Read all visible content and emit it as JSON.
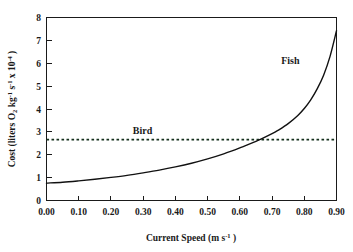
{
  "chart_data": {
    "type": "line",
    "title": "",
    "xlabel_parts": {
      "main": "Current Speed (m s",
      "exponent": "-1",
      "tail": " )"
    },
    "ylabel_parts": {
      "p1": "Cost (liters O",
      "sub1": "2",
      "p2": " kg",
      "sup1": "-1",
      "p3": " s",
      "sup2": "-1",
      "p4": " x 10",
      "sup3": "-4",
      "p5": " )"
    },
    "xlabel": "Current Speed (m s-1 )",
    "ylabel": "Cost (liters O2 kg-1 s-1 x 10-4 )",
    "xlim": [
      0.0,
      0.9
    ],
    "ylim": [
      0,
      8
    ],
    "xticks": [
      0.0,
      0.1,
      0.2,
      0.3,
      0.4,
      0.5,
      0.6,
      0.7,
      0.8,
      0.9
    ],
    "xtick_labels": [
      "0.00",
      "0.10",
      "0.20",
      "0.30",
      "0.40",
      "0.50",
      "0.60",
      "0.70",
      "0.80",
      "0.90"
    ],
    "yticks": [
      0,
      1,
      2,
      3,
      4,
      5,
      6,
      7,
      8
    ],
    "ytick_labels": [
      "0",
      "1",
      "2",
      "3",
      "4",
      "5",
      "6",
      "7",
      "8"
    ],
    "grid": false,
    "legend_position": "inline-annotations",
    "series": [
      {
        "name": "Fish",
        "style": "solid",
        "color": "#111111",
        "label_x": 0.757,
        "label_y": 6.12,
        "x": [
          0.0,
          0.05,
          0.1,
          0.15,
          0.2,
          0.25,
          0.3,
          0.35,
          0.4,
          0.45,
          0.5,
          0.55,
          0.6,
          0.65,
          0.7,
          0.72,
          0.75,
          0.78,
          0.8,
          0.82,
          0.84,
          0.86,
          0.88,
          0.9
        ],
        "values": [
          0.76,
          0.8,
          0.86,
          0.93,
          1.01,
          1.1,
          1.21,
          1.33,
          1.47,
          1.63,
          1.82,
          2.04,
          2.3,
          2.58,
          2.92,
          3.08,
          3.36,
          3.72,
          4.02,
          4.4,
          4.88,
          5.48,
          6.3,
          7.42
        ]
      },
      {
        "name": "Bird",
        "style": "dotted",
        "color": "#15301d",
        "label_x": 0.298,
        "label_y": 3.02,
        "constant_value": 2.66,
        "x": [
          0.0,
          0.9
        ],
        "values": [
          2.66,
          2.66
        ]
      }
    ],
    "annotations": [
      {
        "text": "Fish",
        "x": 0.757,
        "y": 6.12
      },
      {
        "text": "Bird",
        "x": 0.298,
        "y": 3.02
      }
    ],
    "crossover_point": {
      "x": 0.72,
      "y": 2.66
    }
  }
}
